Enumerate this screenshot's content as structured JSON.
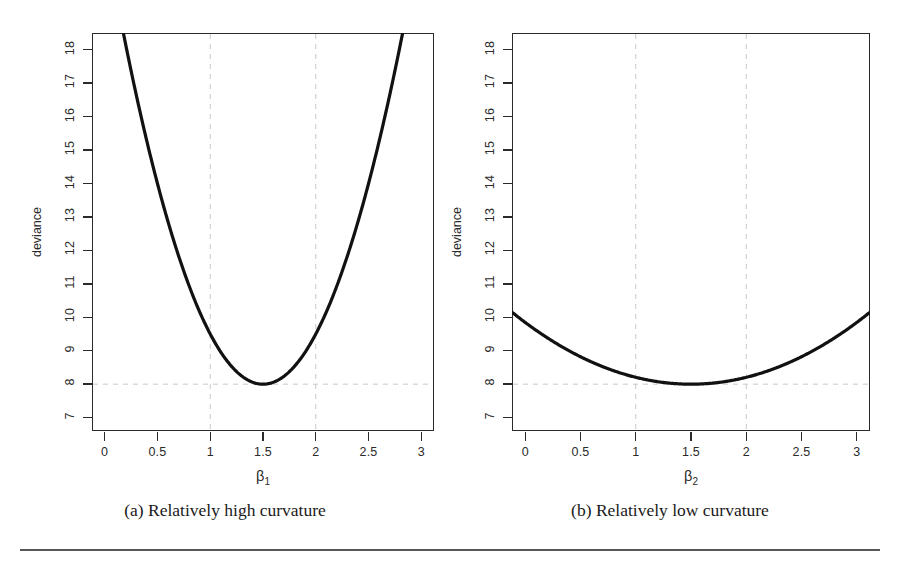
{
  "figure": {
    "background": "#ffffff",
    "axis_color": "#2b2b2b",
    "grid_color": "#c8c8c8",
    "curve_color": "#111111",
    "rule_color": "#585858"
  },
  "panels": [
    {
      "id": "panel-a",
      "caption": "(a) Relatively high curvature",
      "ylabel": "deviance",
      "xlabel_base": "β",
      "xlabel_sub": "1",
      "yticks": [
        "7",
        "8",
        "9",
        "10",
        "11",
        "12",
        "13",
        "14",
        "15",
        "16",
        "17",
        "18"
      ],
      "xticks": [
        "0",
        "0.5",
        "1",
        "1.5",
        "2",
        "2.5",
        "3"
      ]
    },
    {
      "id": "panel-b",
      "caption": "(b) Relatively low curvature",
      "ylabel": "deviance",
      "xlabel_base": "β",
      "xlabel_sub": "2",
      "yticks": [
        "7",
        "8",
        "9",
        "10",
        "11",
        "12",
        "13",
        "14",
        "15",
        "16",
        "17",
        "18"
      ],
      "xticks": [
        "0",
        "0.5",
        "1",
        "1.5",
        "2",
        "2.5",
        "3"
      ]
    }
  ],
  "chart_data": [
    {
      "type": "line",
      "title": "(a) Relatively high curvature",
      "xlabel": "β1",
      "ylabel": "deviance",
      "xlim": [
        -0.12,
        3.12
      ],
      "ylim": [
        6.6,
        18.5
      ],
      "xticks": [
        0,
        0.5,
        1,
        1.5,
        2,
        2.5,
        3
      ],
      "yticks": [
        7,
        8,
        9,
        10,
        11,
        12,
        13,
        14,
        15,
        16,
        17,
        18
      ],
      "grid": true,
      "gridlines": {
        "vertical": [
          1,
          2
        ],
        "horizontal": [
          8
        ]
      },
      "legend": "none",
      "curve_form": "deviance = 8 + 6.0 * (beta1 - 1.5)^2",
      "minimum": {
        "x": 1.5,
        "y": 8
      },
      "curvature_coefficient": 6.0,
      "x": [
        0.16,
        0.3,
        0.5,
        0.7,
        0.9,
        1.1,
        1.3,
        1.5,
        1.7,
        1.9,
        2.1,
        2.3,
        2.5,
        2.7,
        2.84
      ],
      "y": [
        18.5,
        16.64,
        14.0,
        11.84,
        10.16,
        8.96,
        8.24,
        8.0,
        8.24,
        8.96,
        10.16,
        11.84,
        14.0,
        16.64,
        18.5
      ]
    },
    {
      "type": "line",
      "title": "(b) Relatively low curvature",
      "xlabel": "β2",
      "ylabel": "deviance",
      "xlim": [
        -0.12,
        3.12
      ],
      "ylim": [
        6.6,
        18.5
      ],
      "xticks": [
        0,
        0.5,
        1,
        1.5,
        2,
        2.5,
        3
      ],
      "yticks": [
        7,
        8,
        9,
        10,
        11,
        12,
        13,
        14,
        15,
        16,
        17,
        18
      ],
      "grid": true,
      "gridlines": {
        "vertical": [
          1,
          2
        ],
        "horizontal": [
          8
        ]
      },
      "legend": "none",
      "curve_form": "deviance = 8 + 0.82 * (beta2 - 1.5)^2",
      "minimum": {
        "x": 1.5,
        "y": 8
      },
      "curvature_coefficient": 0.82,
      "x": [
        0,
        0.25,
        0.5,
        0.75,
        1.0,
        1.25,
        1.5,
        1.75,
        2.0,
        2.25,
        2.5,
        2.75,
        3.0
      ],
      "y": [
        9.85,
        9.13,
        8.82,
        8.46,
        8.21,
        8.05,
        8.0,
        8.05,
        8.21,
        8.46,
        8.82,
        9.13,
        9.85
      ]
    }
  ]
}
